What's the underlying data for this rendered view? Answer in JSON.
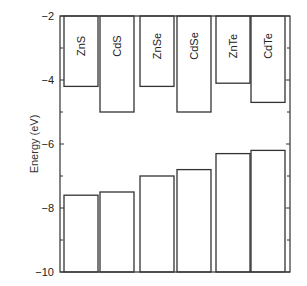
{
  "chart_data": {
    "type": "bar",
    "title": "",
    "xlabel": "",
    "ylabel": "Energy (eV)",
    "ylim": [
      -10,
      -2
    ],
    "yticks": [
      -2,
      -4,
      -6,
      -8,
      -10
    ],
    "grid": false,
    "legend": null,
    "categories": [
      "ZnS",
      "CdS",
      "ZnSe",
      "CdSe",
      "ZnTe",
      "CdTe"
    ],
    "series": [
      {
        "name": "Conduction band edge (bars hanging from top)",
        "values": [
          -4.2,
          -5.0,
          -4.2,
          -5.0,
          -4.1,
          -4.7
        ]
      },
      {
        "name": "Valence band edge (bars rising from bottom)",
        "values": [
          -7.6,
          -7.5,
          -7.0,
          -6.8,
          -6.3,
          -6.2
        ]
      }
    ]
  },
  "axis": {
    "ylabel": "Energy (eV)",
    "tick_labels": [
      "−2",
      "−4",
      "−6",
      "−8",
      "−10"
    ]
  },
  "colors": {
    "axis": "#333333",
    "bar_stroke": "#333333",
    "bar_fill": "#ffffff"
  }
}
